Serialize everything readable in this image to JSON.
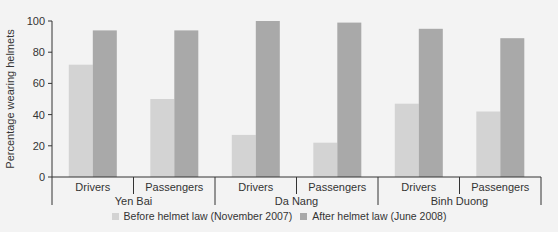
{
  "chart_data": {
    "type": "bar",
    "title": "",
    "xlabel": "",
    "ylabel": "Percentage wearing helmets",
    "ylim": [
      0,
      100
    ],
    "yticks": [
      0,
      20,
      40,
      60,
      80,
      100
    ],
    "grid": false,
    "legend_position": "bottom",
    "groups": [
      {
        "name": "Yen Bai",
        "categories": [
          "Drivers",
          "Passengers"
        ]
      },
      {
        "name": "Da Nang",
        "categories": [
          "Drivers",
          "Passengers"
        ]
      },
      {
        "name": "Binh Duong",
        "categories": [
          "Drivers",
          "Passengers"
        ]
      }
    ],
    "categories": [
      "Yen Bai - Drivers",
      "Yen Bai - Passengers",
      "Da Nang - Drivers",
      "Da Nang - Passengers",
      "Binh Duong - Drivers",
      "Binh Duong - Passengers"
    ],
    "series": [
      {
        "name": "Before helmet law (November 2007)",
        "color": "#d3d3d3",
        "values": [
          72,
          50,
          27,
          22,
          47,
          42
        ]
      },
      {
        "name": "After helmet law (June 2008)",
        "color": "#a9a9a9",
        "values": [
          94,
          94,
          100,
          99,
          95,
          89
        ]
      }
    ]
  },
  "legend": {
    "before_label": "Before helmet law (November 2007)",
    "after_label": "After helmet law (June 2008)"
  },
  "colors": {
    "background": "#f3f3f3",
    "axis": "#333333"
  }
}
